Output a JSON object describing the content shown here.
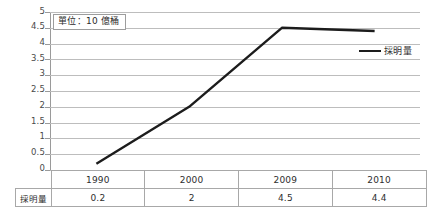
{
  "chart_data": {
    "type": "line",
    "title": "",
    "subtitle": "",
    "xlabel": "",
    "ylabel": "",
    "annotation": "單位：10 億桶",
    "categories": [
      "1990",
      "2000",
      "2009",
      "2010"
    ],
    "series": [
      {
        "name": "採明量",
        "values": [
          0.2,
          2,
          4.5,
          4.4
        ],
        "color": "#1c1c1c"
      }
    ],
    "ylim": [
      0,
      5
    ],
    "ytick_step": 0.5,
    "yticks": [
      "5",
      "4.5",
      "4",
      "3.5",
      "3",
      "2.5",
      "2",
      "1.5",
      "1",
      "0.5",
      "0"
    ],
    "ytick_values": [
      5,
      4.5,
      4,
      3.5,
      3,
      2.5,
      2,
      1.5,
      1,
      0.5,
      0
    ],
    "grid": true,
    "grid_color": "#bdbdbd",
    "legend_position": "right",
    "legend": [
      "採明量"
    ],
    "background": "#ffffff"
  },
  "table": {
    "corner_label": "",
    "header_row": [
      "1990",
      "2000",
      "2009",
      "2010"
    ],
    "row_header": "採明量",
    "data_row": [
      "0.2",
      "2",
      "4.5",
      "4.4"
    ]
  }
}
